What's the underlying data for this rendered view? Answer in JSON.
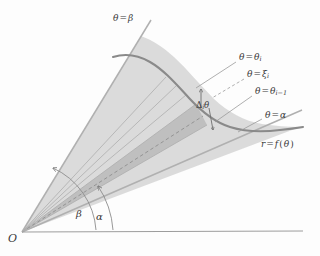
{
  "figure": {
    "type": "polar-area-sector-diagram",
    "background_color": "#fdfdfd",
    "curve_color": "#8a8a8a",
    "ray_color": "#a8a8a8",
    "axis_color": "#9a9a9a",
    "leader_color": "#909090",
    "wedge_fill_outer": "#d6d6d6",
    "wedge_fill_inner": "#bcbcbc",
    "text_color": "#3a3a3a"
  },
  "labels": {
    "theta_beta": {
      "theta": "θ",
      "eq": "=",
      "value": "β"
    },
    "theta_alpha": {
      "theta": "θ",
      "eq": "=",
      "value": "α"
    },
    "theta_i": {
      "theta": "θ",
      "eq": "=",
      "value": "θ",
      "sub": "i"
    },
    "theta_xi": {
      "theta": "θ",
      "eq": "=",
      "value": "ξ",
      "sub": "i"
    },
    "theta_i_minus_1": {
      "theta": "θ",
      "eq": "=",
      "value": "θ",
      "sub": "i−1"
    },
    "curve": {
      "r": "r",
      "eq": "=",
      "f": "f",
      "open": "(",
      "theta": "θ",
      "close": ")"
    },
    "delta_i_theta": {
      "delta": "Δ",
      "sub": "i",
      "theta": "θ"
    },
    "origin": "O",
    "angle_beta": "β",
    "angle_alpha": "α"
  }
}
